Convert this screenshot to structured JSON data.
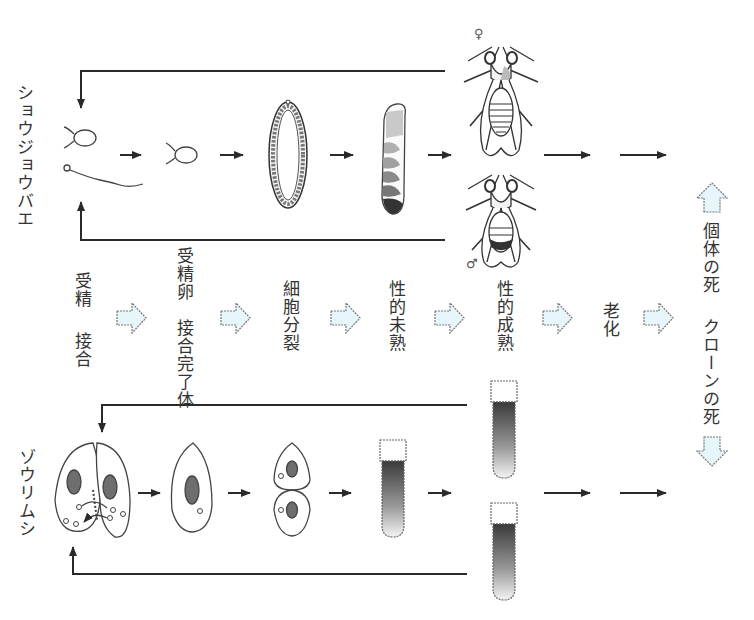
{
  "organisms": {
    "fly": {
      "label": "ショウジョウバエ",
      "female_symbol": "♀",
      "male_symbol": "♂"
    },
    "paramecium": {
      "label": "ゾウリムシ"
    }
  },
  "stages": [
    {
      "id": "fertilization",
      "fly": "受精",
      "paramecium": "接合"
    },
    {
      "id": "zygote",
      "fly": "受精卵",
      "paramecium": "接合完了体"
    },
    {
      "id": "division",
      "label": "細胞分裂"
    },
    {
      "id": "immature",
      "label": "性的未熟"
    },
    {
      "id": "mature",
      "label": "性的成熟"
    },
    {
      "id": "aging",
      "label": "老化"
    }
  ],
  "outcomes": {
    "individual_death": "個体の死",
    "clone_death": "クローンの死"
  },
  "colors": {
    "stage_arrow_fill": "#e6f6fa",
    "stage_arrow_stroke": "#777777",
    "line": "#2a2a2a",
    "nucleus": "#6e6e6e"
  }
}
